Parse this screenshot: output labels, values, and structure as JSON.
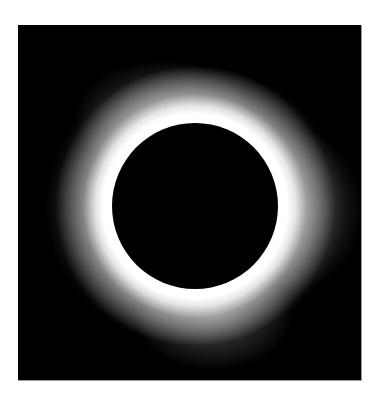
{
  "image": {
    "subject": "total solar eclipse",
    "description": "Black moon disk surrounded by a bright white solar corona on a black background",
    "colors": {
      "background": "#ffffff",
      "sky": "#000000",
      "corona": "#ffffff",
      "moon": "#000000",
      "frame_edge": "#9a9a9a"
    }
  }
}
